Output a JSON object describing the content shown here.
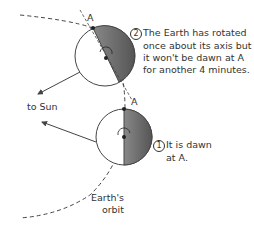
{
  "diagram": {
    "labels": {
      "point_top": "A",
      "point_bottom": "A",
      "to_sun": "to Sun",
      "orbit": [
        "Earth's",
        "orbit"
      ]
    },
    "notes": [
      {
        "marker": "2",
        "lines": [
          "The Earth has rotated",
          "once about its axis but",
          "it won't be dawn at A",
          "for another 4 minutes."
        ]
      },
      {
        "marker": "1",
        "lines": [
          "It is dawn",
          "at A."
        ]
      }
    ],
    "colors": {
      "night_side": "#707070",
      "line": "#444444",
      "text": "#333333"
    }
  }
}
